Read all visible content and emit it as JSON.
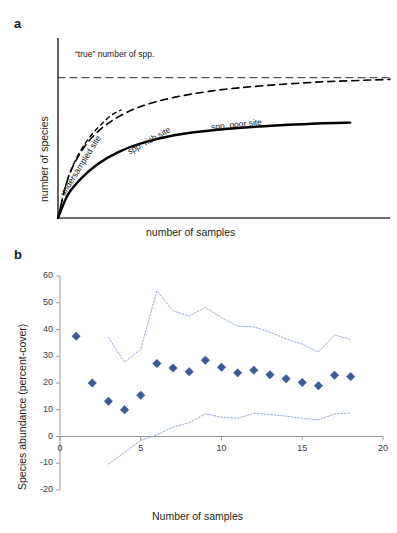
{
  "figure": {
    "panel_a_letter": "a",
    "panel_b_letter": "b"
  },
  "panel_a": {
    "ylabel": "number of species",
    "xlabel": "number of samples",
    "labels": {
      "asymptote": "“true” number of spp.",
      "undersampled": "undersampled site",
      "rich": "spp. rich site",
      "poor": "spp. poor site"
    }
  },
  "panel_b": {
    "ylabel": "Species abundance (percent-cover)",
    "xlabel": "Number of samples"
  },
  "colors": {
    "marker": "#3d5a98",
    "band": "#8fa9d4",
    "axis": "#9c9c9c",
    "curve": "#000000"
  },
  "chart_data": [
    {
      "type": "line",
      "id": "panel-a-species-accumulation",
      "title": "",
      "xlabel": "number of samples",
      "ylabel": "number of species",
      "xlim": [
        0,
        100
      ],
      "ylim": [
        0,
        100
      ],
      "grid": false,
      "legend": "inline-annotations",
      "axis_ticks": false,
      "annotations": [
        {
          "text": "“true” number of spp.",
          "x": 14,
          "y": 84,
          "rotation": 0
        },
        {
          "text": "undersampled site",
          "x": 8,
          "y": 38,
          "rotation": -58
        },
        {
          "text": "spp. rich site",
          "x": 32,
          "y": 62,
          "rotation": -27
        },
        {
          "text": "spp. poor site",
          "x": 58,
          "y": 57,
          "rotation": -6
        }
      ],
      "series": [
        {
          "name": "“true” number of spp.",
          "style": "dashed-horizontal",
          "x": [
            0,
            100
          ],
          "values": [
            78,
            78
          ]
        },
        {
          "name": "undersampled site",
          "style": "dashed-short",
          "x": [
            0,
            2,
            4,
            7,
            10,
            13,
            16,
            19
          ],
          "values": [
            0,
            16,
            27,
            38,
            46,
            52,
            57,
            60
          ]
        },
        {
          "name": "spp. rich site",
          "style": "dashed",
          "x": [
            0,
            3,
            7,
            12,
            18,
            25,
            35,
            48,
            62,
            78,
            92,
            100
          ],
          "values": [
            0,
            22,
            37,
            48,
            56,
            62,
            67,
            71,
            73.5,
            75.5,
            76.5,
            77
          ]
        },
        {
          "name": "spp. poor site",
          "style": "solid",
          "x": [
            0,
            3,
            7,
            12,
            18,
            25,
            35,
            48,
            62,
            78,
            88
          ],
          "values": [
            0,
            13,
            22,
            30,
            36.5,
            41.5,
            46,
            49,
            51,
            52.5,
            53
          ]
        }
      ]
    },
    {
      "type": "scatter",
      "id": "panel-b-abundance-vs-samples",
      "title": "",
      "xlabel": "Number of samples",
      "ylabel": "Species abundance (percent-cover)",
      "xlim": [
        0,
        20
      ],
      "ylim": [
        -20,
        60
      ],
      "xticks": [
        0,
        5,
        10,
        15,
        20
      ],
      "yticks": [
        -20,
        -10,
        0,
        10,
        20,
        30,
        40,
        50,
        60
      ],
      "grid": false,
      "legend": "none",
      "series": [
        {
          "name": "mean species abundance",
          "style": "scatter-diamond",
          "marker": "diamond",
          "color": "#3d5a98",
          "x": [
            1,
            2,
            3,
            4,
            5,
            6,
            7,
            8,
            9,
            10,
            11,
            12,
            13,
            14,
            15,
            16,
            17,
            18
          ],
          "values": [
            37.5,
            20.0,
            13.2,
            10.0,
            15.4,
            27.3,
            25.6,
            24.2,
            28.5,
            25.9,
            23.8,
            24.8,
            23.1,
            21.6,
            20.2,
            19.0,
            22.9,
            22.4
          ]
        },
        {
          "name": "upper confidence limit",
          "style": "dotted",
          "color": "#8fa9d4",
          "x": [
            3,
            4,
            5,
            6,
            7,
            8,
            9,
            10,
            11,
            12,
            13,
            14,
            15,
            16,
            17,
            18
          ],
          "values": [
            37.0,
            27.8,
            32.6,
            54.5,
            47.0,
            45.0,
            48.3,
            44.5,
            41.2,
            41.0,
            39.0,
            36.5,
            34.5,
            31.5,
            38.0,
            36.2
          ]
        },
        {
          "name": "lower confidence limit",
          "style": "dotted",
          "color": "#8fa9d4",
          "x": [
            3,
            4,
            5,
            6,
            7,
            8,
            9,
            10,
            11,
            12,
            13,
            14,
            15,
            16,
            17,
            18
          ],
          "values": [
            -10.3,
            -6.0,
            -1.5,
            0.6,
            3.5,
            5.2,
            8.5,
            7.2,
            6.8,
            8.7,
            8.2,
            7.6,
            6.8,
            6.2,
            8.4,
            8.8
          ]
        }
      ]
    }
  ]
}
